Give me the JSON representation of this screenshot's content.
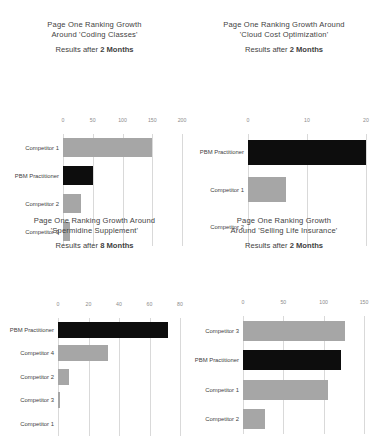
{
  "page": {
    "background": "#ffffff",
    "bar_color_competitor": "#a6a6a6",
    "bar_color_highlight": "#0d0d0d",
    "gridline_color": "#d9d9d9",
    "text_color": "#3f3f3f",
    "tick_color": "#8c8c8c"
  },
  "charts": [
    {
      "id": "coding-classes",
      "title": "Page One Ranking Growth\nAround 'Coding Classes'",
      "subtitle_prefix": "Results after ",
      "subtitle_strong": "2 Months",
      "chart_data": {
        "type": "bar",
        "orientation": "horizontal",
        "title": "Page One Ranking Growth Around 'Coding Classes'",
        "subtitle": "Results after 2 Months",
        "xlabel": "",
        "ylabel": "",
        "xlim": [
          0,
          200
        ],
        "ticks": [
          0,
          50,
          100,
          150,
          200
        ],
        "tick_labels": [
          "0",
          "50",
          "100",
          "150",
          "200"
        ],
        "grid": true,
        "legend": "none",
        "categories": [
          "Competitor 1",
          "PBM Practitioner",
          "Competitor 2",
          "Competitor 3"
        ],
        "values": [
          150,
          50,
          30,
          12
        ],
        "highlight_category": "PBM Practitioner"
      }
    },
    {
      "id": "cloud-cost-optimization",
      "title": "Page One Ranking Growth Around\n'Cloud Cost Optimization'",
      "subtitle_prefix": "Results after ",
      "subtitle_strong": "2 Months",
      "chart_data": {
        "type": "bar",
        "orientation": "horizontal",
        "title": "Page One Ranking Growth Around 'Cloud Cost Optimization'",
        "subtitle": "Results after 2 Months",
        "xlabel": "",
        "ylabel": "",
        "xlim": [
          0,
          20
        ],
        "ticks": [
          0,
          10,
          20
        ],
        "tick_labels": [
          "0",
          "10",
          "20"
        ],
        "grid": true,
        "legend": "none",
        "categories": [
          "PBM Practitioner",
          "Competitor 1",
          "Competitor 2"
        ],
        "values": [
          20,
          6.5,
          0
        ],
        "highlight_category": "PBM Practitioner"
      }
    },
    {
      "id": "spermidine-supplement",
      "title": "Page One Ranking Growth Around\n'Spermidine Supplement'",
      "subtitle_prefix": "Results after ",
      "subtitle_strong": "8 Months",
      "chart_data": {
        "type": "bar",
        "orientation": "horizontal",
        "title": "Page One Ranking Growth Around 'Spermidine Supplement'",
        "subtitle": "Results after 8 Months",
        "xlabel": "",
        "ylabel": "",
        "xlim": [
          0,
          80
        ],
        "ticks": [
          0,
          20,
          40,
          60,
          80
        ],
        "tick_labels": [
          "0",
          "20",
          "40",
          "60",
          "80"
        ],
        "grid": true,
        "legend": "none",
        "categories": [
          "PBM Practitioner",
          "Competitor 4",
          "Competitor 2",
          "Competitor 3",
          "Competitor 1"
        ],
        "values": [
          72,
          33,
          7,
          1,
          0
        ],
        "highlight_category": "PBM Practitioner"
      }
    },
    {
      "id": "selling-life-insurance",
      "title": "Page One Ranking Growth\nAround 'Selling Life Insurance'",
      "subtitle_prefix": "Results after ",
      "subtitle_strong": "2 Months",
      "chart_data": {
        "type": "bar",
        "orientation": "horizontal",
        "title": "Page One Ranking Growth Around 'Selling Life Insurance'",
        "subtitle": "Results after 2 Months",
        "xlabel": "",
        "ylabel": "",
        "xlim": [
          0,
          150
        ],
        "ticks": [
          0,
          50,
          100,
          150
        ],
        "tick_labels": [
          "0",
          "50",
          "100",
          "150"
        ],
        "grid": true,
        "legend": "none",
        "categories": [
          "Competitor 3",
          "PBM Practitioner",
          "Competitor 1",
          "Competitor 2"
        ],
        "values": [
          127,
          122,
          105,
          27
        ],
        "highlight_category": "PBM Practitioner"
      }
    }
  ]
}
